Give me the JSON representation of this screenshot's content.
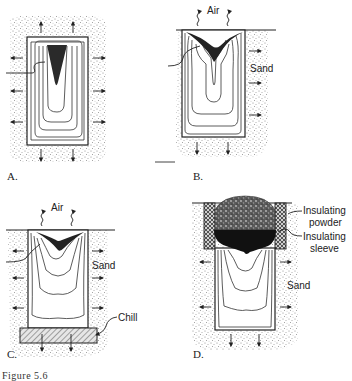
{
  "figure": {
    "panels": [
      {
        "id": "A",
        "letter": "A.",
        "labels": []
      },
      {
        "id": "B",
        "letter": "B.",
        "labels": [
          "Air",
          "Sand"
        ]
      },
      {
        "id": "C",
        "letter": "C.",
        "labels": [
          "Air",
          "Sand",
          "Chill"
        ]
      },
      {
        "id": "D",
        "letter": "D.",
        "labels": [
          "Insulating powder",
          "Insulating sleeve",
          "Sand"
        ]
      }
    ],
    "labels": {
      "b_air": "Air",
      "b_sand": "Sand",
      "c_air": "Air",
      "c_sand": "Sand",
      "c_chill": "Chill",
      "d_powder_1": "Insulating",
      "d_powder_2": "powder",
      "d_sleeve_1": "Insulating",
      "d_sleeve_2": "sleeve",
      "d_sand": "Sand"
    },
    "letters": {
      "a": "A.",
      "b": "B.",
      "c": "C.",
      "d": "D."
    },
    "caption_partial": "Figure 5.6",
    "colors": {
      "ink": "#222222",
      "sand": "#b8b8b8",
      "shrinkage": "#1e1e1e",
      "background": "#ffffff"
    }
  }
}
